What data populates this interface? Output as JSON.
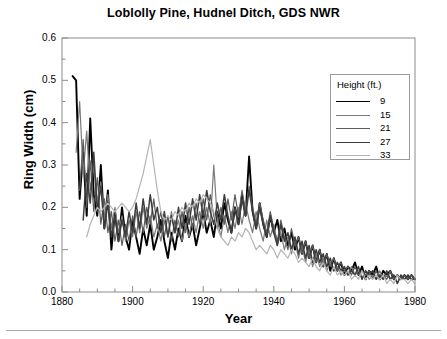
{
  "figure": {
    "title": "Loblolly Pine, Hudnel Ditch, GDS NWR",
    "xlabel": "Year",
    "ylabel": "Ring Width (cm)"
  },
  "legend": {
    "title": "Height (ft.)",
    "entries": [
      {
        "label": "9",
        "color": "#000000",
        "width": 1.9
      },
      {
        "label": "15",
        "color": "#7a7a7a",
        "width": 1.2
      },
      {
        "label": "21",
        "color": "#5c5c5c",
        "width": 1.2
      },
      {
        "label": "27",
        "color": "#3d3d3d",
        "width": 1.5
      },
      {
        "label": "33",
        "color": "#b4b4b4",
        "width": 1.2
      }
    ]
  },
  "axes": {
    "x_ticks": [
      "1880",
      "1900",
      "1920",
      "1940",
      "1960",
      "1980"
    ],
    "y_ticks": [
      "0.0",
      "0.1",
      "0.2",
      "0.3",
      "0.4",
      "0.5",
      "0.6"
    ]
  },
  "chart_data": {
    "type": "line",
    "title": "Loblolly Pine, Hudnel Ditch, GDS NWR",
    "xlabel": "Year",
    "ylabel": "Ring Width (cm)",
    "xlim": [
      1880,
      1980
    ],
    "ylim": [
      0.0,
      0.6
    ],
    "xticks": [
      1880,
      1900,
      1920,
      1940,
      1960,
      1980
    ],
    "yticks": [
      0.0,
      0.1,
      0.2,
      0.3,
      0.4,
      0.5,
      0.6
    ],
    "x_minor_tick_interval": 5,
    "y_minor_tick_interval": 0.05,
    "grid": false,
    "legend_title": "Height (ft.)",
    "legend_position": "upper right",
    "series": [
      {
        "name": "9",
        "color": "#000000",
        "x": [
          1883,
          1884,
          1885,
          1886,
          1887,
          1888,
          1889,
          1890,
          1891,
          1892,
          1893,
          1894,
          1895,
          1896,
          1897,
          1898,
          1899,
          1900,
          1901,
          1902,
          1903,
          1904,
          1905,
          1906,
          1907,
          1908,
          1909,
          1910,
          1911,
          1912,
          1913,
          1914,
          1915,
          1916,
          1917,
          1918,
          1919,
          1920,
          1921,
          1922,
          1923,
          1924,
          1925,
          1926,
          1927,
          1928,
          1929,
          1930,
          1931,
          1932,
          1933,
          1934,
          1935,
          1936,
          1937,
          1938,
          1939,
          1940,
          1941,
          1942,
          1943,
          1944,
          1945,
          1946,
          1947,
          1948,
          1949,
          1950,
          1951,
          1952,
          1953,
          1954,
          1955,
          1956,
          1957,
          1958,
          1959,
          1960,
          1961,
          1962,
          1963,
          1964,
          1965,
          1966,
          1967,
          1968,
          1969,
          1970,
          1971,
          1972,
          1973,
          1974,
          1975,
          1976,
          1977,
          1978,
          1979,
          1980
        ],
        "y": [
          0.51,
          0.5,
          0.22,
          0.33,
          0.18,
          0.41,
          0.23,
          0.18,
          0.3,
          0.15,
          0.24,
          0.1,
          0.19,
          0.12,
          0.2,
          0.13,
          0.1,
          0.17,
          0.13,
          0.09,
          0.15,
          0.11,
          0.16,
          0.1,
          0.13,
          0.17,
          0.12,
          0.08,
          0.14,
          0.1,
          0.15,
          0.12,
          0.18,
          0.13,
          0.16,
          0.11,
          0.15,
          0.19,
          0.14,
          0.17,
          0.13,
          0.19,
          0.15,
          0.21,
          0.17,
          0.14,
          0.2,
          0.16,
          0.23,
          0.18,
          0.32,
          0.19,
          0.15,
          0.21,
          0.16,
          0.13,
          0.18,
          0.14,
          0.17,
          0.12,
          0.15,
          0.11,
          0.14,
          0.1,
          0.13,
          0.09,
          0.12,
          0.08,
          0.11,
          0.07,
          0.1,
          0.06,
          0.09,
          0.05,
          0.08,
          0.05,
          0.07,
          0.04,
          0.06,
          0.05,
          0.07,
          0.04,
          0.06,
          0.03,
          0.05,
          0.04,
          0.06,
          0.03,
          0.05,
          0.04,
          0.05,
          0.03,
          0.04,
          0.03,
          0.04,
          0.03,
          0.04,
          0.03
        ]
      },
      {
        "name": "15",
        "color": "#7a7a7a",
        "x": [
          1884,
          1885,
          1886,
          1887,
          1888,
          1889,
          1890,
          1891,
          1892,
          1893,
          1894,
          1895,
          1896,
          1897,
          1898,
          1899,
          1900,
          1901,
          1902,
          1903,
          1904,
          1905,
          1906,
          1907,
          1908,
          1909,
          1910,
          1911,
          1912,
          1913,
          1914,
          1915,
          1916,
          1917,
          1918,
          1919,
          1920,
          1921,
          1922,
          1923,
          1924,
          1925,
          1926,
          1927,
          1928,
          1929,
          1930,
          1931,
          1932,
          1933,
          1934,
          1935,
          1936,
          1937,
          1938,
          1939,
          1940,
          1941,
          1942,
          1943,
          1944,
          1945,
          1946,
          1947,
          1948,
          1949,
          1950,
          1951,
          1952,
          1953,
          1954,
          1955,
          1956,
          1957,
          1958,
          1959,
          1960,
          1961,
          1962,
          1963,
          1964,
          1965,
          1966,
          1967,
          1968,
          1969,
          1970,
          1971,
          1972,
          1973,
          1974,
          1975,
          1976,
          1977,
          1978,
          1979,
          1980
        ],
        "y": [
          0.33,
          0.45,
          0.28,
          0.38,
          0.24,
          0.3,
          0.21,
          0.26,
          0.17,
          0.23,
          0.15,
          0.2,
          0.14,
          0.18,
          0.12,
          0.17,
          0.13,
          0.19,
          0.14,
          0.2,
          0.15,
          0.18,
          0.13,
          0.16,
          0.12,
          0.17,
          0.13,
          0.19,
          0.14,
          0.17,
          0.12,
          0.16,
          0.13,
          0.18,
          0.14,
          0.19,
          0.15,
          0.2,
          0.16,
          0.3,
          0.17,
          0.13,
          0.18,
          0.14,
          0.19,
          0.15,
          0.2,
          0.16,
          0.21,
          0.17,
          0.14,
          0.19,
          0.15,
          0.12,
          0.17,
          0.13,
          0.16,
          0.11,
          0.14,
          0.1,
          0.13,
          0.09,
          0.12,
          0.08,
          0.11,
          0.07,
          0.1,
          0.06,
          0.09,
          0.06,
          0.08,
          0.05,
          0.07,
          0.05,
          0.06,
          0.04,
          0.05,
          0.04,
          0.06,
          0.04,
          0.05,
          0.03,
          0.05,
          0.03,
          0.04,
          0.03,
          0.05,
          0.03,
          0.04,
          0.03,
          0.04,
          0.02,
          0.04,
          0.03,
          0.04,
          0.03,
          0.03
        ]
      },
      {
        "name": "21",
        "color": "#5c5c5c",
        "x": [
          1885,
          1886,
          1887,
          1888,
          1889,
          1890,
          1891,
          1892,
          1893,
          1894,
          1895,
          1896,
          1897,
          1898,
          1899,
          1900,
          1901,
          1902,
          1903,
          1904,
          1905,
          1906,
          1907,
          1908,
          1909,
          1910,
          1911,
          1912,
          1913,
          1914,
          1915,
          1916,
          1917,
          1918,
          1919,
          1920,
          1921,
          1922,
          1923,
          1924,
          1925,
          1926,
          1927,
          1928,
          1929,
          1930,
          1931,
          1932,
          1933,
          1934,
          1935,
          1936,
          1937,
          1938,
          1939,
          1940,
          1941,
          1942,
          1943,
          1944,
          1945,
          1946,
          1947,
          1948,
          1949,
          1950,
          1951,
          1952,
          1953,
          1954,
          1955,
          1956,
          1957,
          1958,
          1959,
          1960,
          1961,
          1962,
          1963,
          1964,
          1965,
          1966,
          1967,
          1968,
          1969,
          1970,
          1971,
          1972,
          1973,
          1974,
          1975,
          1976,
          1977,
          1978,
          1979,
          1980
        ],
        "y": [
          0.24,
          0.36,
          0.2,
          0.31,
          0.19,
          0.27,
          0.16,
          0.22,
          0.14,
          0.19,
          0.12,
          0.17,
          0.11,
          0.16,
          0.12,
          0.18,
          0.13,
          0.19,
          0.14,
          0.2,
          0.16,
          0.22,
          0.15,
          0.19,
          0.13,
          0.18,
          0.12,
          0.17,
          0.13,
          0.19,
          0.14,
          0.2,
          0.15,
          0.21,
          0.16,
          0.22,
          0.17,
          0.23,
          0.18,
          0.15,
          0.2,
          0.16,
          0.22,
          0.17,
          0.23,
          0.18,
          0.24,
          0.19,
          0.25,
          0.2,
          0.16,
          0.21,
          0.17,
          0.14,
          0.19,
          0.15,
          0.12,
          0.17,
          0.13,
          0.1,
          0.15,
          0.11,
          0.13,
          0.09,
          0.12,
          0.08,
          0.11,
          0.07,
          0.1,
          0.06,
          0.09,
          0.06,
          0.08,
          0.05,
          0.07,
          0.05,
          0.06,
          0.04,
          0.06,
          0.04,
          0.05,
          0.04,
          0.05,
          0.03,
          0.05,
          0.03,
          0.04,
          0.03,
          0.05,
          0.03,
          0.04,
          0.03,
          0.04,
          0.03,
          0.04,
          0.03
        ]
      },
      {
        "name": "27",
        "color": "#3d3d3d",
        "x": [
          1886,
          1887,
          1888,
          1889,
          1890,
          1891,
          1892,
          1893,
          1894,
          1895,
          1896,
          1897,
          1898,
          1899,
          1900,
          1901,
          1902,
          1903,
          1904,
          1905,
          1906,
          1907,
          1908,
          1909,
          1910,
          1911,
          1912,
          1913,
          1914,
          1915,
          1916,
          1917,
          1918,
          1919,
          1920,
          1921,
          1922,
          1923,
          1924,
          1925,
          1926,
          1927,
          1928,
          1929,
          1930,
          1931,
          1932,
          1933,
          1934,
          1935,
          1936,
          1937,
          1938,
          1939,
          1940,
          1941,
          1942,
          1943,
          1944,
          1945,
          1946,
          1947,
          1948,
          1949,
          1950,
          1951,
          1952,
          1953,
          1954,
          1955,
          1956,
          1957,
          1958,
          1959,
          1960,
          1961,
          1962,
          1963,
          1964,
          1965,
          1966,
          1967,
          1968,
          1969,
          1970,
          1971,
          1972,
          1973,
          1974,
          1975,
          1976,
          1977,
          1978,
          1979,
          1980
        ],
        "y": [
          0.17,
          0.28,
          0.21,
          0.33,
          0.19,
          0.25,
          0.15,
          0.21,
          0.13,
          0.18,
          0.12,
          0.17,
          0.13,
          0.19,
          0.14,
          0.21,
          0.15,
          0.22,
          0.16,
          0.23,
          0.17,
          0.2,
          0.14,
          0.19,
          0.13,
          0.18,
          0.14,
          0.2,
          0.15,
          0.21,
          0.16,
          0.22,
          0.17,
          0.23,
          0.18,
          0.24,
          0.19,
          0.16,
          0.21,
          0.17,
          0.23,
          0.18,
          0.14,
          0.2,
          0.16,
          0.22,
          0.18,
          0.24,
          0.19,
          0.15,
          0.2,
          0.16,
          0.13,
          0.18,
          0.14,
          0.11,
          0.16,
          0.12,
          0.14,
          0.1,
          0.13,
          0.09,
          0.12,
          0.08,
          0.11,
          0.07,
          0.1,
          0.07,
          0.09,
          0.06,
          0.08,
          0.05,
          0.07,
          0.05,
          0.06,
          0.04,
          0.05,
          0.04,
          0.06,
          0.03,
          0.05,
          0.04,
          0.05,
          0.03,
          0.04,
          0.03,
          0.05,
          0.03,
          0.04,
          0.02,
          0.04,
          0.03,
          0.04,
          0.03,
          0.03
        ]
      },
      {
        "name": "33",
        "color": "#b4b4b4",
        "x": [
          1887,
          1888,
          1889,
          1890,
          1891,
          1892,
          1893,
          1894,
          1895,
          1896,
          1897,
          1898,
          1899,
          1900,
          1901,
          1902,
          1903,
          1904,
          1905,
          1906,
          1907,
          1908,
          1909,
          1910,
          1911,
          1912,
          1913,
          1914,
          1915,
          1916,
          1917,
          1918,
          1919,
          1920,
          1921,
          1922,
          1923,
          1924,
          1925,
          1926,
          1927,
          1928,
          1929,
          1930,
          1931,
          1932,
          1933,
          1934,
          1935,
          1936,
          1937,
          1938,
          1939,
          1940,
          1941,
          1942,
          1943,
          1944,
          1945,
          1946,
          1947,
          1948,
          1949,
          1950,
          1951,
          1952,
          1953,
          1954,
          1955,
          1956,
          1957,
          1958,
          1959,
          1960,
          1961,
          1962,
          1963,
          1964,
          1965,
          1966,
          1967,
          1968,
          1969,
          1970,
          1971,
          1972,
          1973,
          1974,
          1975,
          1976,
          1977,
          1978,
          1979,
          1980
        ],
        "y": [
          0.13,
          0.16,
          0.18,
          0.2,
          0.19,
          0.2,
          0.21,
          0.2,
          0.19,
          0.2,
          0.21,
          0.2,
          0.19,
          0.2,
          0.22,
          0.25,
          0.28,
          0.32,
          0.36,
          0.3,
          0.24,
          0.19,
          0.17,
          0.18,
          0.17,
          0.19,
          0.18,
          0.2,
          0.19,
          0.21,
          0.2,
          0.22,
          0.21,
          0.23,
          0.22,
          0.21,
          0.19,
          0.15,
          0.13,
          0.12,
          0.11,
          0.13,
          0.12,
          0.14,
          0.13,
          0.15,
          0.14,
          0.12,
          0.1,
          0.11,
          0.1,
          0.09,
          0.11,
          0.1,
          0.08,
          0.1,
          0.09,
          0.08,
          0.1,
          0.09,
          0.07,
          0.08,
          0.07,
          0.06,
          0.08,
          0.06,
          0.05,
          0.07,
          0.05,
          0.04,
          0.06,
          0.04,
          0.05,
          0.04,
          0.05,
          0.03,
          0.04,
          0.03,
          0.05,
          0.03,
          0.04,
          0.03,
          0.04,
          0.03,
          0.04,
          0.02,
          0.03,
          0.02,
          0.04,
          0.03,
          0.03,
          0.02,
          0.03,
          0.02
        ]
      }
    ]
  }
}
